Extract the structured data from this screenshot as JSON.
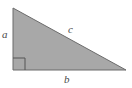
{
  "figure": {
    "kind": "right-triangle-diagram",
    "background_color": "#ffffff",
    "fill_color": "#a8a8a8",
    "stroke_color": "#6b6b6b",
    "label_color": "#4a4a4a",
    "labels": {
      "leg_vertical": "a",
      "leg_horizontal": "b",
      "hypotenuse": "c"
    },
    "geometry": {
      "apex": [
        13,
        8
      ],
      "right_angle_vertex": [
        13,
        70
      ],
      "far_vertex": [
        126,
        70
      ],
      "right_angle_marker_size": 12
    }
  }
}
